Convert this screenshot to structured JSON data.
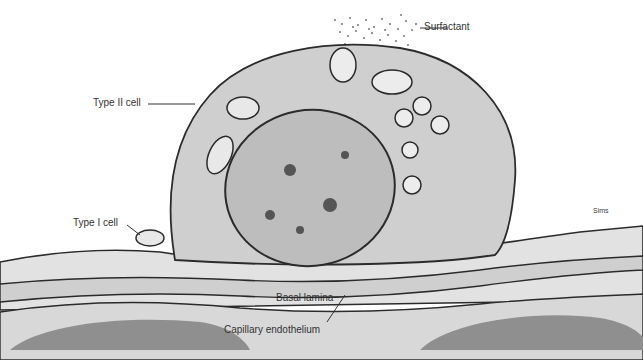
{
  "diagram": {
    "labels": {
      "surfactant": "Surfactant",
      "type2_cell": "Type II cell",
      "type1_cell": "Type I cell",
      "basal_lamina": "Basal lamina",
      "capillary_endothelium": "Capillary endothelium",
      "signature": "Sims"
    },
    "colors": {
      "cytoplasm": "#cfcfcf",
      "nucleus": "#bdbdbd",
      "membrane": "#2b2b2b",
      "basal_layer": "#e4e4e4",
      "endothelium": "#c8c8c8",
      "capillary_lumen": "#8f8f8f",
      "background": "#ffffff"
    }
  }
}
